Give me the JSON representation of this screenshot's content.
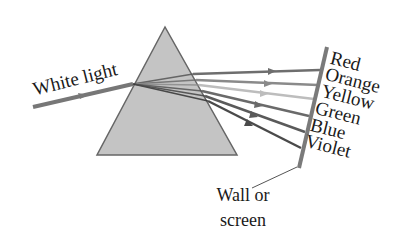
{
  "diagram": {
    "incoming_label": "White light",
    "wall_label_line1": "Wall or",
    "wall_label_line2": "screen",
    "spectrum": [
      {
        "name": "Red",
        "color": "#6e6e6e"
      },
      {
        "name": "Orange",
        "color": "#8a8a8a"
      },
      {
        "name": "Yellow",
        "color": "#b9b9b9"
      },
      {
        "name": "Green",
        "color": "#6a6a6a"
      },
      {
        "name": "Blue",
        "color": "#5a5a5a"
      },
      {
        "name": "Violet",
        "color": "#4a4a4a"
      }
    ],
    "colors": {
      "prism_fill": "#c4c4c4",
      "prism_stroke": "#666666",
      "wall": "#7a7a7a",
      "incoming_ray": "#777777"
    }
  }
}
